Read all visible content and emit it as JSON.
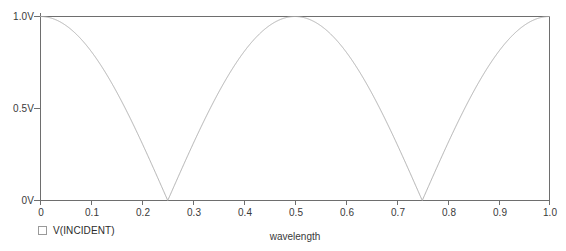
{
  "chart_data": {
    "type": "line",
    "title": "",
    "xlabel": "wavelength",
    "ylabel": "",
    "xlim": [
      0,
      1.0
    ],
    "ylim": [
      0,
      1.0
    ],
    "grid": false,
    "legend_position": "bottom-left",
    "x_tick_labels": [
      "0",
      "0.1",
      "0.2",
      "0.3",
      "0.4",
      "0.5",
      "0.6",
      "0.7",
      "0.8",
      "0.9",
      "1.0"
    ],
    "x_tick_values": [
      0,
      0.1,
      0.2,
      0.3,
      0.4,
      0.5,
      0.6,
      0.7,
      0.8,
      0.9,
      1.0
    ],
    "y_tick_labels": [
      "0V",
      "0.5V",
      "1.0V"
    ],
    "y_tick_values": [
      0,
      0.5,
      1.0
    ],
    "series": [
      {
        "name": "V(INCIDENT)",
        "color": "#b0b0b0",
        "description": "Rectified cosine magnitude: |cos(2*pi*x)| volts versus wavelength",
        "x": [
          0,
          0.025,
          0.05,
          0.075,
          0.1,
          0.125,
          0.15,
          0.175,
          0.2,
          0.225,
          0.25,
          0.275,
          0.3,
          0.325,
          0.35,
          0.375,
          0.4,
          0.425,
          0.45,
          0.475,
          0.5,
          0.525,
          0.55,
          0.575,
          0.6,
          0.625,
          0.65,
          0.675,
          0.7,
          0.725,
          0.75,
          0.775,
          0.8,
          0.825,
          0.85,
          0.875,
          0.9,
          0.925,
          0.95,
          0.975,
          1.0
        ],
        "y": [
          1.0,
          0.988,
          0.951,
          0.891,
          0.809,
          0.707,
          0.588,
          0.454,
          0.309,
          0.156,
          0.0,
          0.156,
          0.309,
          0.454,
          0.588,
          0.707,
          0.809,
          0.891,
          0.951,
          0.988,
          1.0,
          0.988,
          0.951,
          0.891,
          0.809,
          0.707,
          0.588,
          0.454,
          0.309,
          0.156,
          0.0,
          0.156,
          0.309,
          0.454,
          0.588,
          0.707,
          0.809,
          0.891,
          0.951,
          0.988,
          1.0
        ]
      }
    ],
    "maxima_at": [
      0,
      0.5,
      1.0
    ],
    "minima_at": [
      0.25,
      0.75
    ],
    "peak_value": 1.0,
    "trough_value": 0.0
  },
  "legend": {
    "marker": "hollow-square",
    "label": "V(INCIDENT)"
  },
  "axis": {
    "x_title": "wavelength"
  },
  "footer": {
    "clipped_text": " "
  },
  "colors": {
    "trace": "#b0b0b0",
    "frame": "#6e6e6e",
    "text": "#2b2b2b",
    "background": "#ffffff"
  }
}
